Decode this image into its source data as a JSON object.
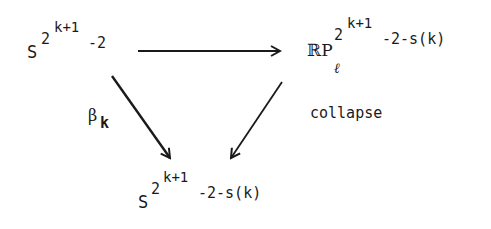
{
  "diagram": {
    "type": "commutative-triangle",
    "nodes": {
      "top_left": {
        "base": "S",
        "exp_base": "2",
        "exp_exp": "k+1",
        "exp_tail": "-2"
      },
      "top_right": {
        "base": "ℝP",
        "subscript": "ℓ",
        "exp_base": "2",
        "exp_exp": "k+1",
        "exp_tail": "-2-s(k)"
      },
      "bottom": {
        "base": "S",
        "exp_base": "2",
        "exp_exp": "k+1",
        "exp_tail": "-2-s(k)"
      }
    },
    "edges": [
      {
        "from": "top_left",
        "to": "top_right",
        "label": ""
      },
      {
        "from": "top_left",
        "to": "bottom",
        "label_main": "β",
        "label_sub": "k"
      },
      {
        "from": "top_right",
        "to": "bottom",
        "label": "collapse"
      }
    ],
    "colors": {
      "ink": "#1a1a1a",
      "background": "#ffffff"
    }
  }
}
